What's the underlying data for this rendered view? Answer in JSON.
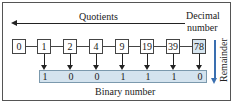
{
  "diagram": {
    "top_label": "Quotients",
    "decimal_label_line1": "Decimal",
    "decimal_label_line2": "number",
    "remainder_label": "Remainder",
    "binary_label": "Binary number",
    "quotients": [
      "0",
      "1",
      "2",
      "4",
      "9",
      "19",
      "39",
      "78"
    ],
    "highlighted_index": 7,
    "bits": [
      "1",
      "0",
      "0",
      "1",
      "1",
      "1",
      "0"
    ],
    "colors": {
      "highlight_box": "#d7e6f0",
      "binary_bar": "#d4e3ee",
      "remainder_arrow": "#3a6fb0"
    }
  }
}
